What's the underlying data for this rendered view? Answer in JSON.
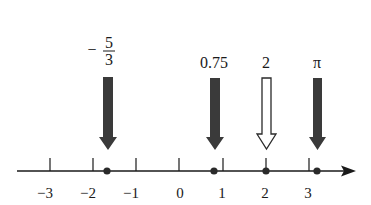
{
  "diagram": {
    "type": "number-line",
    "axis": {
      "x_start": 17,
      "x_end": 355,
      "y": 171,
      "unit_px": 43,
      "zero_x": 179,
      "color": "#1a1a1a",
      "arrow": "right"
    },
    "ticks": [
      {
        "value": -3,
        "label": "−3"
      },
      {
        "value": -2,
        "label": "−2"
      },
      {
        "value": -1,
        "label": "−1"
      },
      {
        "value": 0,
        "label": "0"
      },
      {
        "value": 1,
        "label": "1"
      },
      {
        "value": 2,
        "label": "2"
      },
      {
        "value": 3,
        "label": "3"
      }
    ],
    "markers": [
      {
        "id": "neg-five-thirds",
        "value": -1.6667,
        "label": "−5/3",
        "label_kind": "fraction",
        "numerator": "5",
        "denominator": "3",
        "sign": "−",
        "style": "filled"
      },
      {
        "id": "zero-point-seven-five",
        "value": 0.75,
        "label": "0.75",
        "label_kind": "text",
        "style": "filled"
      },
      {
        "id": "two",
        "value": 2,
        "label": "2",
        "label_kind": "text",
        "style": "hollow"
      },
      {
        "id": "pi",
        "value": 3.14159,
        "label": "π",
        "label_kind": "text",
        "style": "filled"
      }
    ],
    "colors": {
      "filled_arrow": "#3a3a3a",
      "hollow_arrow_stroke": "#2a2a2a",
      "hollow_arrow_fill": "#ffffff",
      "dot": "#2a2a2a",
      "axis": "#1a1a1a"
    }
  }
}
